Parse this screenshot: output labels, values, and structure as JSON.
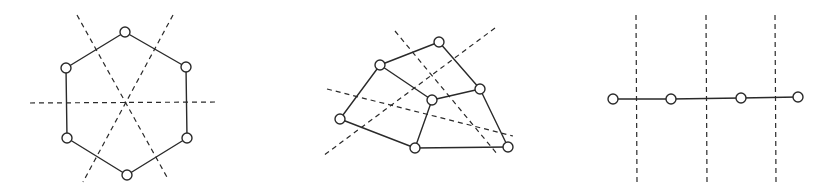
{
  "diagram": {
    "background": "#ffffff",
    "stroke_color": "#2a2a2a",
    "node_radius": 5,
    "figures": [
      {
        "name": "hexagon-graph",
        "nodes": [
          {
            "id": "h1",
            "x": 125,
            "y": 32
          },
          {
            "id": "h2",
            "x": 186,
            "y": 67
          },
          {
            "id": "h3",
            "x": 187,
            "y": 138
          },
          {
            "id": "h4",
            "x": 127,
            "y": 175
          },
          {
            "id": "h5",
            "x": 67,
            "y": 138
          },
          {
            "id": "h6",
            "x": 66,
            "y": 68
          }
        ],
        "edges": [
          [
            "h1",
            "h2"
          ],
          [
            "h2",
            "h3"
          ],
          [
            "h3",
            "h4"
          ],
          [
            "h4",
            "h5"
          ],
          [
            "h5",
            "h6"
          ],
          [
            "h6",
            "h1"
          ]
        ],
        "symmetry_axes": [
          {
            "x1": 30,
            "y1": 103,
            "x2": 216,
            "y2": 102
          },
          {
            "x1": 77,
            "y1": 15,
            "x2": 168,
            "y2": 179
          },
          {
            "x1": 173,
            "y1": 15,
            "x2": 83,
            "y2": 182
          }
        ]
      },
      {
        "name": "irregular-graph",
        "nodes": [
          {
            "id": "a",
            "x": 439,
            "y": 42
          },
          {
            "id": "b",
            "x": 380,
            "y": 65
          },
          {
            "id": "c",
            "x": 480,
            "y": 89
          },
          {
            "id": "d",
            "x": 432,
            "y": 100
          },
          {
            "id": "e",
            "x": 340,
            "y": 119
          },
          {
            "id": "f",
            "x": 415,
            "y": 148
          },
          {
            "id": "g",
            "x": 508,
            "y": 147
          }
        ],
        "edges": [
          [
            "b",
            "a"
          ],
          [
            "a",
            "c"
          ],
          [
            "b",
            "d"
          ],
          [
            "d",
            "c"
          ],
          [
            "b",
            "e"
          ],
          [
            "e",
            "f"
          ],
          [
            "d",
            "f"
          ],
          [
            "f",
            "g"
          ],
          [
            "c",
            "g"
          ]
        ],
        "symmetry_axes": [
          {
            "x1": 395,
            "y1": 31,
            "x2": 498,
            "y2": 155
          },
          {
            "x1": 495,
            "y1": 28,
            "x2": 323,
            "y2": 156
          },
          {
            "x1": 327,
            "y1": 89,
            "x2": 513,
            "y2": 136
          }
        ]
      },
      {
        "name": "path-graph",
        "nodes": [
          {
            "id": "p1",
            "x": 613,
            "y": 99
          },
          {
            "id": "p2",
            "x": 671,
            "y": 99
          },
          {
            "id": "p3",
            "x": 741,
            "y": 98
          },
          {
            "id": "p4",
            "x": 798,
            "y": 97
          }
        ],
        "edges": [
          [
            "p1",
            "p2"
          ],
          [
            "p2",
            "p3"
          ],
          [
            "p3",
            "p4"
          ]
        ],
        "symmetry_axes": [
          {
            "x1": 636,
            "y1": 15,
            "x2": 637,
            "y2": 182
          },
          {
            "x1": 706,
            "y1": 15,
            "x2": 707,
            "y2": 182
          },
          {
            "x1": 775,
            "y1": 15,
            "x2": 776,
            "y2": 182
          }
        ]
      }
    ]
  }
}
